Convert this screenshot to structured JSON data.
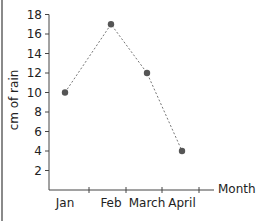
{
  "chart_data": {
    "type": "line",
    "title": "",
    "xlabel": "Month",
    "ylabel": "cm of rain",
    "categories": [
      "Jan",
      "Feb",
      "March",
      "April"
    ],
    "values": [
      10,
      17,
      12,
      4
    ],
    "yticks": [
      2,
      4,
      6,
      8,
      10,
      12,
      14,
      16,
      18
    ],
    "ylim": [
      0,
      18
    ],
    "grid": false,
    "legend": null,
    "line_style": "dashed",
    "marker": "circle",
    "colors": {
      "line": "#777777",
      "marker": "#555555",
      "axis": "#444444"
    }
  }
}
